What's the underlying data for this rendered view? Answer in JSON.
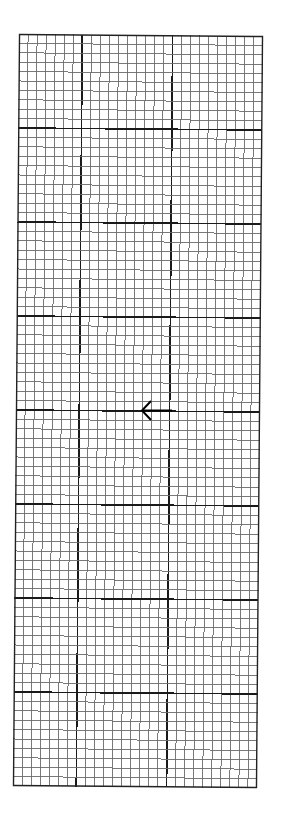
{
  "grid": {
    "columns": 27,
    "rows": 80,
    "major_column_lines": [
      7,
      17
    ],
    "major_row_every": 10,
    "minor_color": "#6a6a6a",
    "major_color": "#1a1a1a",
    "border_color": "#222222",
    "background": "#ffffff"
  },
  "arrow": {
    "icon": "arrow-left-icon",
    "direction": "left",
    "color": "#000000"
  }
}
